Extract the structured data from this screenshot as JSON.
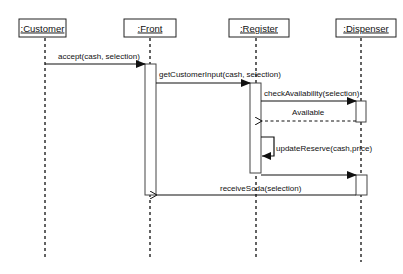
{
  "diagram": {
    "type": "UML sequence diagram",
    "objects": [
      {
        "id": "customer",
        "label": ":Customer",
        "x": 42
      },
      {
        "id": "front",
        "label": ":Front",
        "x": 150
      },
      {
        "id": "register",
        "label": ":Register",
        "x": 256
      },
      {
        "id": "dispenser",
        "label": ":Dispenser",
        "x": 361
      }
    ],
    "messages": [
      {
        "id": "m1",
        "label": "accept(cash, selection)",
        "from": "customer",
        "to": "front",
        "kind": "sync"
      },
      {
        "id": "m2",
        "label": "getCustomerInput(cash, selection)",
        "from": "front",
        "to": "register",
        "kind": "sync"
      },
      {
        "id": "m3",
        "label": "checkAvailability(selection)",
        "from": "register",
        "to": "dispenser",
        "kind": "sync"
      },
      {
        "id": "m4",
        "label": "Available",
        "from": "dispenser",
        "to": "register",
        "kind": "return"
      },
      {
        "id": "m5",
        "label": "updateReserve(cash,price)",
        "from": "register",
        "to": "register",
        "kind": "self"
      },
      {
        "id": "m6",
        "label": "",
        "from": "register",
        "to": "dispenser",
        "kind": "sync"
      },
      {
        "id": "m7",
        "label": "receiveSoda(selection)",
        "from": "dispenser",
        "to": "front",
        "kind": "sync"
      }
    ]
  }
}
